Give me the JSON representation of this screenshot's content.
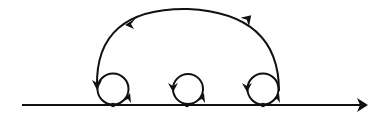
{
  "diagram": {
    "type": "contour-diagram",
    "stroke_color": "#111111",
    "background": "#ffffff",
    "axis": {
      "x_start": 22,
      "x_end": 368,
      "y": 105,
      "arrow": "right"
    },
    "points": [
      {
        "x": 113,
        "y": 105
      },
      {
        "x": 187,
        "y": 105
      },
      {
        "x": 263,
        "y": 105
      }
    ],
    "loops": [
      {
        "cx": 113,
        "cy": 89,
        "r": 16,
        "direction": "counterclockwise"
      },
      {
        "cx": 188,
        "cy": 89,
        "r": 15,
        "direction": "counterclockwise"
      },
      {
        "cx": 263,
        "cy": 89,
        "r": 16,
        "direction": "counterclockwise"
      }
    ],
    "big_arc": {
      "from": {
        "x": 279,
        "y": 90
      },
      "to": {
        "x": 97,
        "y": 86
      },
      "top_y": 9,
      "direction": "counterclockwise"
    }
  }
}
